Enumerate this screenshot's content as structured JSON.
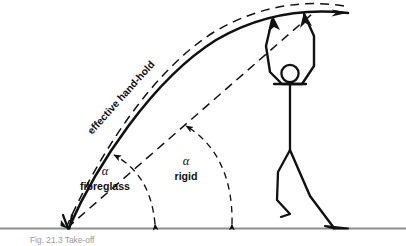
{
  "figure": {
    "background_color": "#ffffff",
    "ink_color": "#111111",
    "ground_color": "#8d8d8d",
    "width": 406,
    "height": 246
  },
  "labels": {
    "effective_hand_hold": "effective hand-hold",
    "alpha_symbol_left": "α",
    "fibreglass": "fibreglass",
    "alpha_symbol_right": "α",
    "rigid": "rigid"
  },
  "caption": {
    "text": "Fig. 21.3  Take-off"
  },
  "elements": {
    "ground_line": "ground-line",
    "fibreglass_pole": "fibreglass-pole-curve",
    "effective_hand_hold_curve": "effective-hand-hold-dashed-curve",
    "rigid_pole_line": "rigid-pole-dashed-line",
    "angle_arc_fibreglass": "angle-arc-fibreglass",
    "angle_arc_rigid": "angle-arc-rigid",
    "vaulter": "vaulter-stick-figure",
    "vaulter_head": "vaulter-head",
    "vaulter_arms": "vaulter-arms",
    "vaulter_torso": "vaulter-torso",
    "vaulter_leg_lead": "vaulter-lead-leg",
    "vaulter_leg_plant": "vaulter-plant-leg",
    "pole_plant_point": "pole-plant-point",
    "hand_hold_point": "hand-hold-point"
  }
}
